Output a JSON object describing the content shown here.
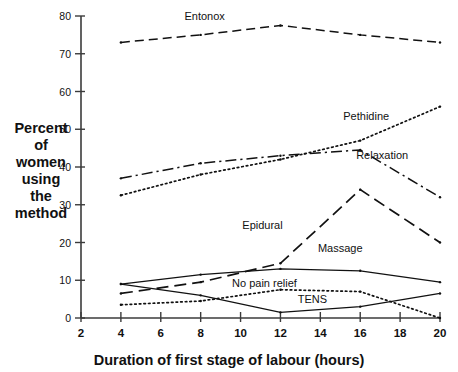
{
  "chart_data": {
    "type": "line",
    "title": "",
    "xlabel": "Duration of first stage of labour (hours)",
    "ylabel": "Percent of women using the method",
    "ylabel_lines": [
      "Percent",
      "of",
      "women",
      "using",
      "the",
      "method"
    ],
    "x": [
      4,
      8,
      12,
      16,
      20
    ],
    "xlim": [
      2,
      20
    ],
    "ylim": [
      0,
      80
    ],
    "xticks": [
      2,
      4,
      6,
      8,
      10,
      12,
      14,
      16,
      18,
      20
    ],
    "yticks": [
      0,
      10,
      20,
      30,
      40,
      50,
      60,
      70,
      80
    ],
    "grid": false,
    "legend_position": "inline-annotations",
    "series": [
      {
        "name": "Entonox",
        "style": "dashed",
        "values": [
          73.0,
          75.0,
          77.5,
          75.0,
          73.0
        ],
        "label_x": 8.2,
        "label_y": 79.0
      },
      {
        "name": "Pethidine",
        "style": "dotted",
        "values": [
          32.5,
          38.0,
          42.0,
          47.0,
          56.0
        ],
        "label_x": 16.3,
        "label_y": 52.5
      },
      {
        "name": "Relaxation",
        "style": "dashdot",
        "values": [
          37.0,
          41.0,
          43.0,
          44.5,
          32.0
        ],
        "label_x": 17.1,
        "label_y": 42.0
      },
      {
        "name": "Epidural",
        "style": "longdash",
        "values": [
          6.5,
          9.5,
          14.5,
          34.0,
          20.0
        ],
        "label_x": 11.1,
        "label_y": 23.5
      },
      {
        "name": "Massage",
        "style": "solid",
        "values": [
          9.0,
          11.5,
          13.0,
          12.5,
          9.5
        ],
        "label_x": 15.0,
        "label_y": 17.5
      },
      {
        "name": "No pain relief",
        "style": "solid",
        "values": [
          9.0,
          6.0,
          1.5,
          3.0,
          6.5
        ],
        "label_x": 11.2,
        "label_y": 8.2
      },
      {
        "name": "TENS",
        "style": "dotted",
        "values": [
          3.5,
          4.5,
          7.5,
          7.0,
          0.0
        ],
        "label_x": 13.6,
        "label_y": 4.0
      }
    ]
  }
}
